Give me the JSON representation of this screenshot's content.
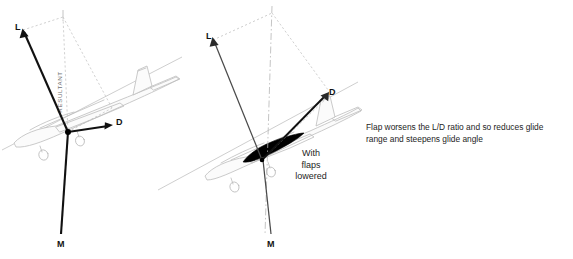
{
  "figure": {
    "background_color": "#ffffff",
    "ink_color": "#111111",
    "outline_color": "#bcbcbc"
  },
  "panels": [
    {
      "id": "clean",
      "name": "clean-configuration-panel",
      "vectors": [
        {
          "id": "lift",
          "label": "L",
          "name": "lift-vector",
          "style": "heavy"
        },
        {
          "id": "drag",
          "label": "D",
          "name": "drag-vector",
          "style": "heavy"
        },
        {
          "id": "weight",
          "label": "M",
          "name": "weight-vector",
          "style": "heavy"
        },
        {
          "id": "resultant",
          "label": "RESULTANT",
          "name": "resultant-vector",
          "style": "dash-dot"
        }
      ]
    },
    {
      "id": "flapped",
      "name": "flaps-lowered-panel",
      "note_lines": [
        "With",
        "flaps",
        "lowered"
      ],
      "vectors": [
        {
          "id": "lift",
          "label": "L",
          "name": "lift-vector",
          "style": "medium"
        },
        {
          "id": "drag",
          "label": "D",
          "name": "drag-vector",
          "style": "dark"
        },
        {
          "id": "weight",
          "label": "M",
          "name": "weight-vector",
          "style": "medium"
        },
        {
          "id": "resultant",
          "label": "",
          "name": "resultant-vector",
          "style": "dash-dot"
        }
      ]
    }
  ],
  "caption": {
    "line1": "Flap worsens the L/D ratio and so reduces glide",
    "line2": "range and steepens glide angle"
  },
  "labels": {
    "lift_left": "L",
    "drag_left": "D",
    "weight_left": "M",
    "resultant_left": "RESULTANT",
    "lift_right": "L",
    "drag_right": "D",
    "weight_right": "M",
    "flaps_line1": "With",
    "flaps_line2": "flaps",
    "flaps_line3": "lowered"
  }
}
